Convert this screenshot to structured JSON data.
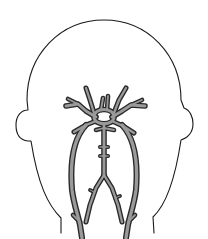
{
  "figure": {
    "background": "#ffffff",
    "outline_color": "#1a1a1a",
    "vessel_edge_color": "#2a2a2a",
    "vessel_fill_color": "#9a9a9a",
    "head_outline": "M 28 238 L 28 228 C 18 210 14 185 14 155 C 14 60 60 20 104 20 C 148 20 194 60 194 155 C 194 185 190 210 180 228 L 180 238",
    "head_outline_detailed": "M 61 233 L 61 218 C 48 205 38 185 31 141 L 28 141 C 19 140 16 133 16 125 C 16 116 21 110 28 110 L 27 100 C 27 55 60 20 104 20 C 148 20 181 55 181 100 L 184 108 C 190 110 193 117 193 124 C 193 132 188 138 181 140 C 175 180 166 205 153 217 L 154 233",
    "vessels": [
      {
        "name": "circle-of-willis",
        "d": "M 94 117 C 94 107 114 107 114 117 C 114 126 94 126 94 117 Z",
        "width": 4
      },
      {
        "name": "left-mca",
        "d": "M 96 117 L 86 111 L 78 104 L 66 106",
        "width": 4
      },
      {
        "name": "left-mca-branch",
        "d": "M 78 104 L 68 99",
        "width": 3
      },
      {
        "name": "right-mca",
        "d": "M 112 117 L 122 111 L 131 105 L 145 106",
        "width": 4
      },
      {
        "name": "right-mca-branch",
        "d": "M 131 105 L 142 100",
        "width": 3
      },
      {
        "name": "left-aca-up",
        "d": "M 94 113 L 90 100 L 86 88",
        "width": 3.5
      },
      {
        "name": "right-aca-up",
        "d": "M 114 113 L 119 100 L 126 88",
        "width": 3.5
      },
      {
        "name": "left-center-branch",
        "d": "M 101 110 L 103 98",
        "width": 3
      },
      {
        "name": "right-center-branch",
        "d": "M 107 110 L 108 96",
        "width": 3
      },
      {
        "name": "left-pca",
        "d": "M 96 121 L 86 125 L 74 132",
        "width": 3.5
      },
      {
        "name": "right-pca",
        "d": "M 112 121 L 123 126 L 134 133",
        "width": 3.5
      },
      {
        "name": "basilar-crossbar",
        "d": "M 96 130 L 104 128 L 114 130",
        "width": 3
      },
      {
        "name": "basilar-artery",
        "d": "M 104 124 L 104 175",
        "width": 4
      },
      {
        "name": "basilar-side-1",
        "d": "M 100 147 L 108 147",
        "width": 2.5
      },
      {
        "name": "basilar-side-2",
        "d": "M 100 156 L 108 156",
        "width": 2.5
      },
      {
        "name": "left-vertebral",
        "d": "M 104 175 L 96 188 L 90 205 L 86 222",
        "width": 3.5
      },
      {
        "name": "right-vertebral",
        "d": "M 104 175 L 112 188 L 118 205 L 122 222",
        "width": 3.5
      },
      {
        "name": "left-vertebral-twig",
        "d": "M 94 192 L 90 190",
        "width": 2.2
      },
      {
        "name": "right-vertebral-twig",
        "d": "M 115 198 L 120 196",
        "width": 2.2
      },
      {
        "name": "left-carotid",
        "d": "M 86 125 C 72 140 70 165 72 190 C 74 205 78 215 80 225 L 82 238",
        "width": 4.5
      },
      {
        "name": "right-carotid",
        "d": "M 122 125 C 136 140 138 165 136 190 C 134 205 130 215 128 225 L 126 238",
        "width": 4.5
      },
      {
        "name": "left-carotid-spur",
        "d": "M 80 222 L 73 215",
        "width": 3
      },
      {
        "name": "right-carotid-spur",
        "d": "M 128 222 L 135 215",
        "width": 3
      }
    ]
  }
}
